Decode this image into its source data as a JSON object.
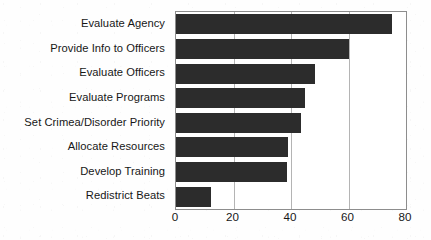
{
  "chart_data": {
    "type": "bar",
    "orientation": "horizontal",
    "title": "",
    "subtitle": "",
    "xlabel": "",
    "ylabel": "",
    "categories": [
      "Evaluate Agency",
      "Provide Info to Officers",
      "Evaluate Officers",
      "Evaluate Programs",
      "Set Crimea/Disorder Priority",
      "Allocate Resources",
      "Develop Training",
      "Redistrict Beats"
    ],
    "values": [
      75,
      60,
      48.5,
      45,
      43.5,
      39,
      38.5,
      12
    ],
    "xlim": [
      0,
      80
    ],
    "xticks": [
      0,
      20,
      40,
      60,
      80
    ],
    "xtick_labels": [
      "0",
      "20",
      "40",
      "60",
      "80"
    ],
    "gridlines_x": [
      20,
      40,
      60
    ],
    "grid": true,
    "legend": false,
    "legend_position": "none",
    "series": [
      {
        "name": "",
        "values": [
          75,
          60,
          48.5,
          45,
          43.5,
          39,
          38.5,
          12
        ]
      }
    ],
    "colors": {
      "bar": "#2c2c2c",
      "gridline": "#b4b4b4",
      "frame": "#8d8d8d",
      "background": "#ffffff",
      "text": "#171717"
    }
  }
}
